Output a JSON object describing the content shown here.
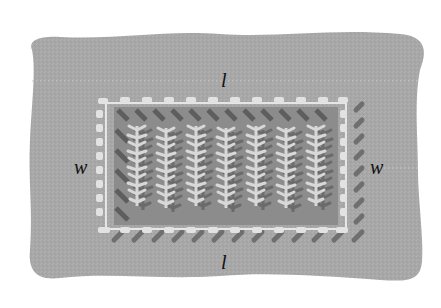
{
  "diagram": {
    "type": "fenced garden plot",
    "labels": {
      "top": "l",
      "bottom": "l",
      "left": "w",
      "right": "w"
    },
    "plant_rows": 7,
    "colors": {
      "ground": "#a9a9a9",
      "garden_bed": "#8e8e8e",
      "fence": "#e4e4e4",
      "fence_shadow": "#6e6e6e",
      "plants": "#d6d6d6",
      "plant_shadow": "#6a6a6a",
      "label_text": "#111111",
      "dotted_guides": "#c8c8c8"
    }
  }
}
